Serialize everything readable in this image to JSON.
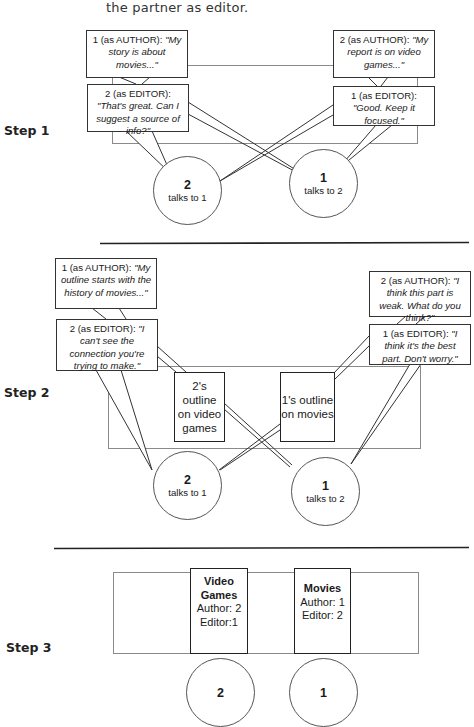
{
  "intro_text": "the partner as editor.",
  "steps": [
    {
      "label": "Step 1",
      "bubbles": [
        {
          "speaker": "1 (as AUTHOR): ",
          "quote": "\"My story is about movies...\""
        },
        {
          "speaker": "2 (as EDITOR): ",
          "quote": "\"That's great. Can I suggest a source of info?\""
        },
        {
          "speaker": "2 (as AUTHOR): ",
          "quote": "\"My report is on video games...\""
        },
        {
          "speaker": "1 (as EDITOR): ",
          "quote": "\"Good. Keep it focused.\""
        }
      ],
      "students": [
        {
          "number": "2",
          "caption": "talks to 1"
        },
        {
          "number": "1",
          "caption": "talks to 2"
        }
      ]
    },
    {
      "label": "Step 2",
      "bubbles": [
        {
          "speaker": "1 (as AUTHOR): ",
          "quote": "\"My outline starts with the history of movies...\""
        },
        {
          "speaker": "2 (as EDITOR): ",
          "quote": "\"I can't see the connection you're trying to make.\""
        },
        {
          "speaker": "2 (as AUTHOR): ",
          "quote": "\"I think this part is weak. What do you think?\""
        },
        {
          "speaker": "1 (as EDITOR): ",
          "quote": "\"I think it's the best part. Don't worry.\""
        }
      ],
      "documents": [
        {
          "text": "2's outline on video games"
        },
        {
          "text": "1's outline on movies"
        }
      ],
      "students": [
        {
          "number": "2",
          "caption": "talks to 1"
        },
        {
          "number": "1",
          "caption": "talks to 2"
        }
      ]
    },
    {
      "label": "Step 3",
      "documents": [
        {
          "title": "Video Games",
          "author": "Author: 2",
          "editor": "Editor:1"
        },
        {
          "title": "Movies",
          "author": "Author: 1",
          "editor": "Editor: 2"
        }
      ],
      "students": [
        {
          "number": "2"
        },
        {
          "number": "1"
        }
      ]
    }
  ],
  "colors": {
    "line": "#333333",
    "table_outline": "#8a8a8a",
    "divider": "#222222"
  }
}
